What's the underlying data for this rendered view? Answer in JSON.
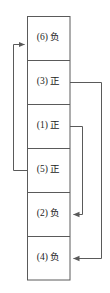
{
  "diagram": {
    "type": "flow-table-with-pointers",
    "title": "",
    "colors": {
      "line": "#5a5a5a",
      "text": "#1a1a1a",
      "background": "#ffffff"
    },
    "table": {
      "rows": [
        {
          "index": "(6)",
          "sign": "负",
          "label": "(6) 负"
        },
        {
          "index": "(3)",
          "sign": "正",
          "label": "(3) 正"
        },
        {
          "index": "(1)",
          "sign": "正",
          "label": "(1) 正"
        },
        {
          "index": "(5)",
          "sign": "正",
          "label": "(5) 正"
        },
        {
          "index": "(2)",
          "sign": "负",
          "label": "(2) 负"
        },
        {
          "index": "(4)",
          "sign": "负",
          "label": "(4) 负"
        }
      ]
    },
    "connectors": [
      {
        "name": "connector-5-to-6",
        "from": "(5) 正",
        "to": "(6) 负",
        "side": "left"
      },
      {
        "name": "connector-3-to-4",
        "from": "(3) 正",
        "to": "(4) 负",
        "side": "right-outer"
      },
      {
        "name": "connector-1-to-2",
        "from": "(1) 正",
        "to": "(2) 负",
        "side": "right-inner"
      }
    ]
  }
}
